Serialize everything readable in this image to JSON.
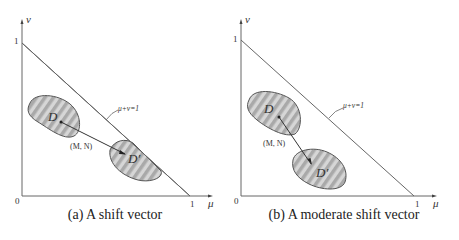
{
  "figure": {
    "panels": [
      {
        "id": "a",
        "caption": "(a) A shift vector",
        "origin_label": "0",
        "x_tick_label": "1",
        "y_tick_label": "1",
        "x_axis_label": "μ",
        "y_axis_label": "ν",
        "line_label": "μ+ν=1",
        "region_start_label": "D",
        "region_end_label": "D′",
        "vector_label": "(M, N)"
      },
      {
        "id": "b",
        "caption": "(b) A moderate shift vector",
        "origin_label": "0",
        "x_tick_label": "1",
        "y_tick_label": "1",
        "x_axis_label": "μ",
        "y_axis_label": "ν",
        "line_label": "μ+ν=1",
        "region_start_label": "D",
        "region_end_label": "D′",
        "vector_label": "(M, N)"
      }
    ],
    "colors": {
      "axis": "#555555",
      "region_fill_light": "#d4d4d4",
      "region_fill_dark": "#a8a8a8",
      "region_stroke": "#555555",
      "text": "#333333"
    }
  }
}
